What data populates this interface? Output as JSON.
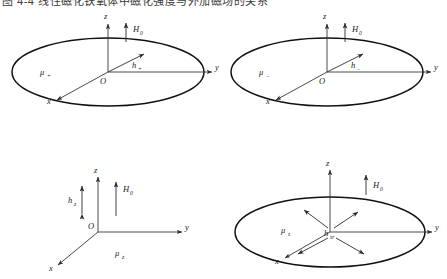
{
  "caption": {
    "text": "图 4-4  线性磁化铁氧体中磁化强度与外加磁场的关系"
  },
  "figure": {
    "title": "",
    "axis_labels": {
      "x": "x",
      "y": "y",
      "z": "z",
      "origin": "O"
    },
    "panels": [
      {
        "id": "panel-top-left",
        "position": "top-left",
        "has_plane_ellipse": true,
        "labels": {
          "bias_field": "H",
          "bias_field_sub": "0",
          "rf_field": "h",
          "rf_field_sub": "+",
          "permeability": "μ",
          "permeability_sub": "+"
        },
        "bias_arrow_direction": "up",
        "rf_arrow_direction": "up-right-in-plane"
      },
      {
        "id": "panel-top-right",
        "position": "top-right",
        "has_plane_ellipse": true,
        "labels": {
          "bias_field": "H",
          "bias_field_sub": "0",
          "rf_field": "h",
          "rf_field_sub": "−",
          "permeability": "μ",
          "permeability_sub": "−"
        },
        "bias_arrow_direction": "up",
        "rf_arrow_direction": "up-right-in-plane"
      },
      {
        "id": "panel-bottom-left",
        "position": "bottom-left",
        "has_plane_ellipse": false,
        "labels": {
          "bias_field": "H",
          "bias_field_sub": "0",
          "rf_field": "h",
          "rf_field_sub": "z",
          "permeability": "μ",
          "permeability_sub": "z"
        },
        "bias_arrow_direction": "up",
        "rf_arrow_direction": "double-vertical"
      },
      {
        "id": "panel-bottom-right",
        "position": "bottom-right",
        "has_plane_ellipse": true,
        "labels": {
          "bias_field": "H",
          "bias_field_sub": "0",
          "rf_field": "h",
          "rf_field_sub": "sr",
          "permeability": "μ",
          "permeability_sub": "s"
        },
        "bias_arrow_direction": "up",
        "rf_arrow_direction": "radial-four-way"
      }
    ],
    "colors": {
      "stroke": "#1a1a1a",
      "axis": "#2b2b2b",
      "background": "#ffffff"
    }
  }
}
